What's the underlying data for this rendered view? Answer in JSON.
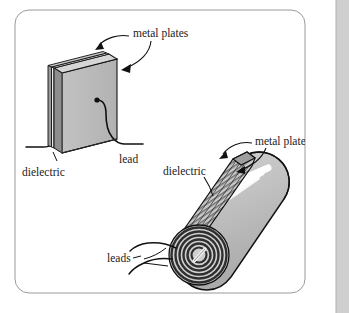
{
  "figure": {
    "frame": {
      "border_color": "#9a9a9a",
      "background_color": "#ffffff",
      "edge_band_color": "#cfcfcf",
      "corner_radius": 14
    },
    "palette": {
      "outline": "#111111",
      "plate_face": "#b8b8b8",
      "plate_top": "#d6d6d6",
      "plate_edge_dark": "#8e8e8e",
      "dielectric_light": "#e8e8e8",
      "cylinder_body": "#c2c2c2",
      "cylinder_highlight": "#ffffff",
      "spiral_dark": "#4a4a4a",
      "wire": "#111111"
    },
    "objects": [
      {
        "name": "flat-plate-capacitor",
        "description": "Isometric rectangular slab capacitor with two metal plates sandwiching a dielectric layer and two lead wires"
      },
      {
        "name": "rolled-cylindrical-capacitor",
        "description": "Tilted cylinder formed by rolling the layered sheet, spiral cross-section visible at the near end with two leads"
      }
    ],
    "labels": {
      "flat_metal_plates": "metal plates",
      "flat_dielectric": "dielectric",
      "flat_lead": "lead",
      "rolled_metal_plates": "metal plates",
      "rolled_dielectric": "dielectric",
      "rolled_leads": "leads"
    }
  }
}
